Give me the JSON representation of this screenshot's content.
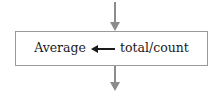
{
  "diagram": {
    "type": "flowchart-process-step",
    "process_box": {
      "statement": {
        "target": "Average",
        "operator": "←",
        "operator_name": "assignment-arrow-left",
        "expression": "total/count",
        "full_text": "Average ← total/count"
      }
    },
    "connectors": [
      {
        "name": "incoming-flow-arrow",
        "direction": "down",
        "position": "top",
        "description": "arrow entering the process box from above"
      },
      {
        "name": "outgoing-flow-arrow",
        "direction": "down",
        "position": "bottom",
        "description": "arrow leaving the process box downward"
      }
    ],
    "colors": {
      "background": "#ffffff",
      "box_border": "#9a9a9a",
      "box_fill": "#ffffff",
      "connector": "#8c8c8c",
      "text": "#1a1a1a"
    }
  }
}
